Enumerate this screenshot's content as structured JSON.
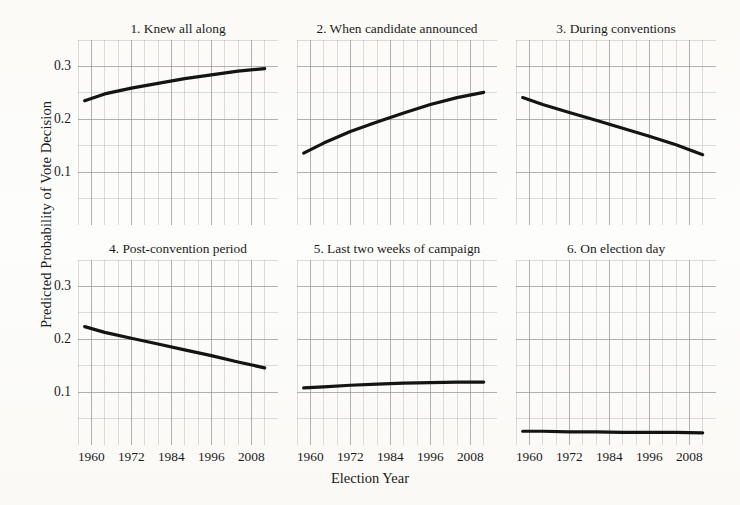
{
  "figure": {
    "xlabel": "Election Year",
    "ylabel": "Predicted Probability of Vote Decision"
  },
  "chart_data": {
    "type": "line",
    "title": "",
    "subtitle": "",
    "xlabel": "Election Year",
    "ylabel": "Predicted Probability of Vote Decision",
    "xlim": [
      1956,
      2016
    ],
    "ylim": [
      0.0,
      0.35
    ],
    "xticks": [
      1960,
      1972,
      1984,
      1996,
      2008
    ],
    "xtick_labels": [
      "1960",
      "1972",
      "1984",
      "1996",
      "2008"
    ],
    "x_minor_tick_step": 4,
    "yticks": [
      0.1,
      0.2,
      0.3
    ],
    "ytick_labels": [
      "0.1",
      "0.2",
      "0.3"
    ],
    "y_minor_tick_step": 0.05,
    "grid": true,
    "grid_color": "#9a9a9a",
    "line_color": "#141414",
    "line_width": 3.2,
    "legend": "none",
    "layout": "small-multiples 2 rows x 3 columns",
    "panels": [
      {
        "index": 1,
        "title": "1. Knew all along",
        "x": [
          1958,
          1964,
          1972,
          1980,
          1988,
          1996,
          2004,
          2012
        ],
        "y": [
          0.235,
          0.248,
          0.259,
          0.268,
          0.277,
          0.284,
          0.291,
          0.296
        ]
      },
      {
        "index": 2,
        "title": "2. When candidate announced",
        "x": [
          1958,
          1964,
          1972,
          1980,
          1988,
          1996,
          2004,
          2012
        ],
        "y": [
          0.136,
          0.155,
          0.177,
          0.195,
          0.212,
          0.228,
          0.241,
          0.251
        ]
      },
      {
        "index": 3,
        "title": "3. During conventions",
        "x": [
          1958,
          1964,
          1972,
          1980,
          1988,
          1996,
          2004,
          2012
        ],
        "y": [
          0.241,
          0.228,
          0.213,
          0.198,
          0.183,
          0.168,
          0.152,
          0.133
        ]
      },
      {
        "index": 4,
        "title": "4. Post-convention period",
        "x": [
          1958,
          1964,
          1972,
          1980,
          1988,
          1996,
          2004,
          2012
        ],
        "y": [
          0.224,
          0.213,
          0.202,
          0.191,
          0.18,
          0.169,
          0.157,
          0.146
        ]
      },
      {
        "index": 5,
        "title": "5. Last two weeks of campaign",
        "x": [
          1958,
          1964,
          1972,
          1980,
          1988,
          1996,
          2004,
          2012
        ],
        "y": [
          0.108,
          0.11,
          0.113,
          0.115,
          0.117,
          0.118,
          0.119,
          0.119
        ]
      },
      {
        "index": 6,
        "title": "6. On election day",
        "x": [
          1958,
          1964,
          1972,
          1980,
          1988,
          1996,
          2004,
          2012
        ],
        "y": [
          0.026,
          0.026,
          0.025,
          0.025,
          0.024,
          0.024,
          0.024,
          0.023
        ]
      }
    ]
  }
}
